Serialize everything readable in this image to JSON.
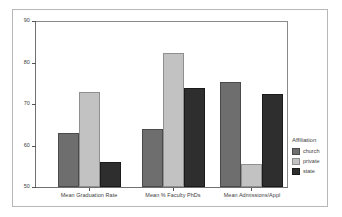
{
  "chart_data": {
    "type": "bar",
    "title": "",
    "xlabel": "",
    "ylabel": "",
    "ylim": [
      50,
      90
    ],
    "yticks": [
      50,
      60,
      70,
      80,
      90
    ],
    "ytick_labels": [
      "50",
      "60",
      "70",
      "80",
      "90"
    ],
    "grid": false,
    "legend_position": "right",
    "legend_title": "Affiliation",
    "categories": [
      "Mean Graduation Rate",
      "Mean % Faculty PhDs",
      "Mean Admissions/Appl"
    ],
    "series": [
      {
        "name": "church",
        "color": "#6e6e6e",
        "values": [
          63.0,
          64.0,
          75.5
        ]
      },
      {
        "name": "private",
        "color": "#c2c2c2",
        "values": [
          73.0,
          82.5,
          55.5
        ]
      },
      {
        "name": "state",
        "color": "#2e2e2e",
        "values": [
          56.0,
          74.0,
          72.5
        ]
      }
    ]
  },
  "axis": {
    "tick_50": "50",
    "tick_60": "60",
    "tick_70": "70",
    "tick_80": "80",
    "tick_90": "90"
  },
  "legend": {
    "title": "Affiliation",
    "items": [
      {
        "label": "church"
      },
      {
        "label": "private"
      },
      {
        "label": "state"
      }
    ]
  },
  "xaxis": {
    "labels": [
      "Mean Graduation Rate",
      "Mean % Faculty PhDs",
      "Mean Admissions/Appl"
    ]
  }
}
